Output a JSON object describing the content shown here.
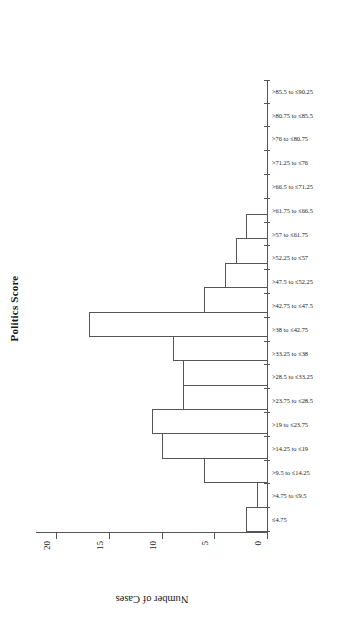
{
  "chart_data": {
    "type": "bar",
    "title": "Politics Score",
    "xlabel": "",
    "ylabel": "Number of Cases",
    "ylim": [
      0,
      22
    ],
    "yticks": [
      0,
      5,
      10,
      15,
      20
    ],
    "grid": false,
    "legend": null,
    "orientation": "page-rotated-90-ccw",
    "categories": [
      "≤4.75",
      ">4.75 to ≤9.5",
      ">9.5 to ≤14.25",
      ">14.25 to ≤19",
      ">19 to ≤23.75",
      ">23.75 to ≤28.5",
      ">28.5 to ≤33.25",
      ">33.25 to ≤38",
      ">38 to ≤42.75",
      ">42.75 to ≤47.5",
      ">47.5 to ≤52.25",
      ">52.25 to ≤57",
      ">57 to ≤61.75",
      ">61.75 to ≤66.5",
      ">66.5 to ≤71.25",
      ">71.25 to ≤76",
      ">76 to ≤80.75",
      ">80.75 to ≤85.5",
      ">85.5 to ≤90.25"
    ],
    "values": [
      2,
      1,
      6,
      10,
      11,
      8,
      8,
      9,
      17,
      6,
      4,
      3,
      2,
      0,
      0,
      0,
      0,
      0,
      0
    ],
    "axis_color": "#555555",
    "bar_fill": "#ffffff",
    "bar_stroke": "#555555"
  }
}
